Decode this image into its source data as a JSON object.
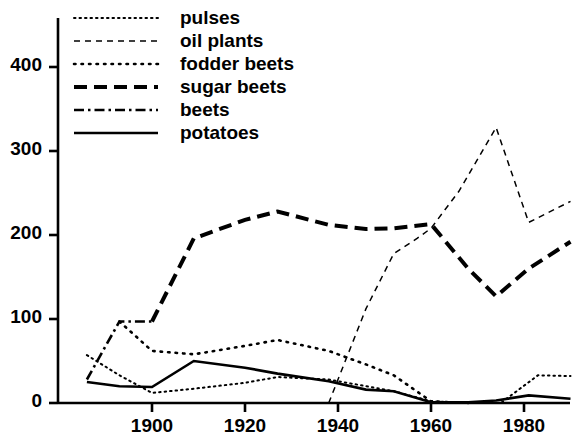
{
  "chart_data": {
    "type": "line",
    "title": "",
    "xlabel": "",
    "ylabel": "ha",
    "xlim": [
      1886,
      1990
    ],
    "ylim": [
      0,
      430
    ],
    "grid": false,
    "legend_position": "top-left",
    "yticks": [
      0,
      100,
      200,
      300,
      400
    ],
    "xticks": [
      1900,
      1920,
      1940,
      1960,
      1980
    ],
    "series": [
      {
        "name": "pulses",
        "style": "fine-dotted",
        "points": [
          [
            1886,
            57
          ],
          [
            1893,
            33
          ],
          [
            1900,
            12
          ],
          [
            1909,
            17
          ],
          [
            1920,
            24
          ],
          [
            1927,
            31
          ],
          [
            1938,
            28
          ],
          [
            1946,
            20
          ],
          [
            1952,
            14
          ],
          [
            1960,
            2
          ],
          [
            1968,
            0
          ],
          [
            1975,
            0
          ],
          [
            1983,
            33
          ],
          [
            1990,
            32
          ]
        ]
      },
      {
        "name": "oil plants",
        "style": "dashed-fine",
        "points": [
          [
            1938,
            0
          ],
          [
            1946,
            112
          ],
          [
            1952,
            178
          ],
          [
            1957,
            196
          ],
          [
            1960,
            208
          ],
          [
            1966,
            252
          ],
          [
            1974,
            328
          ],
          [
            1981,
            215
          ],
          [
            1990,
            240
          ]
        ]
      },
      {
        "name": "fodder beets",
        "style": "dotted",
        "points": [
          [
            1893,
            97
          ],
          [
            1900,
            62
          ],
          [
            1909,
            58
          ],
          [
            1920,
            68
          ],
          [
            1927,
            75
          ],
          [
            1938,
            62
          ],
          [
            1946,
            46
          ],
          [
            1952,
            33
          ],
          [
            1960,
            2
          ],
          [
            1968,
            0
          ]
        ]
      },
      {
        "name": "sugar beets",
        "style": "long-dashed",
        "points": [
          [
            1900,
            97
          ],
          [
            1909,
            196
          ],
          [
            1920,
            218
          ],
          [
            1927,
            228
          ],
          [
            1938,
            212
          ],
          [
            1946,
            207
          ],
          [
            1952,
            208
          ],
          [
            1960,
            213
          ],
          [
            1968,
            160
          ],
          [
            1974,
            127
          ],
          [
            1981,
            160
          ],
          [
            1990,
            192
          ]
        ]
      },
      {
        "name": "beets",
        "style": "dash-dot",
        "points": [
          [
            1886,
            28
          ],
          [
            1893,
            97
          ],
          [
            1900,
            97
          ]
        ]
      },
      {
        "name": "potatoes",
        "style": "solid",
        "points": [
          [
            1886,
            25
          ],
          [
            1893,
            20
          ],
          [
            1900,
            19
          ],
          [
            1909,
            50
          ],
          [
            1920,
            42
          ],
          [
            1927,
            35
          ],
          [
            1938,
            26
          ],
          [
            1946,
            16
          ],
          [
            1952,
            14
          ],
          [
            1960,
            1
          ],
          [
            1968,
            1
          ],
          [
            1974,
            3
          ],
          [
            1981,
            9
          ],
          [
            1990,
            5
          ]
        ]
      }
    ]
  },
  "legend": {
    "items": [
      {
        "label": "pulses",
        "style": "fine-dotted"
      },
      {
        "label": "oil plants",
        "style": "dashed-fine"
      },
      {
        "label": "fodder beets",
        "style": "dotted"
      },
      {
        "label": "sugar beets",
        "style": "long-dashed"
      },
      {
        "label": "beets",
        "style": "dash-dot"
      },
      {
        "label": "potatoes",
        "style": "solid"
      }
    ]
  },
  "colors": {
    "ink": "#000000",
    "background": "#ffffff"
  }
}
